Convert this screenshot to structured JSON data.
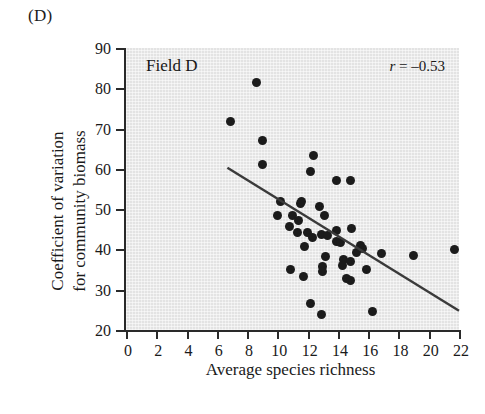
{
  "panel": {
    "letter": "(D)"
  },
  "annotations": {
    "field_label": "Field D",
    "correlation_symbol": "r",
    "correlation_text": " = –0.53",
    "correlation_full": "r = –0.53"
  },
  "axes": {
    "x_title": "Average species richness",
    "y_title_line1": "Coefficient of variation",
    "y_title_line2": "for community biomass",
    "x_ticks": [
      "0",
      "2",
      "4",
      "6",
      "8",
      "10",
      "12",
      "14",
      "16",
      "18",
      "20",
      "22"
    ],
    "y_ticks": [
      "90",
      "80",
      "70",
      "60",
      "50",
      "40",
      "30",
      "20"
    ]
  },
  "colors": {
    "panel_background": "#e3e3e3",
    "axis": "#2a2a2a",
    "point": "#1b1b1b",
    "trend_line": "#3a3a3a",
    "text": "#1a1a1a",
    "page_background": "#ffffff"
  },
  "chart_data": {
    "type": "scatter",
    "title": "Field D",
    "xlabel": "Average species richness",
    "ylabel": "Coefficient of variation for community biomass",
    "xlim": [
      0,
      22
    ],
    "ylim": [
      20,
      90
    ],
    "xticks": [
      0,
      2,
      4,
      6,
      8,
      10,
      12,
      14,
      16,
      18,
      20,
      22
    ],
    "yticks": [
      20,
      30,
      40,
      50,
      60,
      70,
      80,
      90
    ],
    "grid": false,
    "legend": "none",
    "correlation_r": -0.53,
    "annotation": "r = –0.53",
    "points": [
      [
        8.6,
        81.5
      ],
      [
        6.9,
        71.7
      ],
      [
        9.0,
        67.0
      ],
      [
        9.0,
        61.2
      ],
      [
        12.4,
        63.2
      ],
      [
        12.2,
        59.4
      ],
      [
        13.9,
        57.2
      ],
      [
        14.8,
        57.0
      ],
      [
        10.2,
        51.8
      ],
      [
        11.5,
        51.4
      ],
      [
        11.6,
        51.9
      ],
      [
        12.8,
        50.6
      ],
      [
        10.0,
        48.5
      ],
      [
        11.0,
        48.3
      ],
      [
        11.4,
        47.2
      ],
      [
        13.1,
        48.5
      ],
      [
        10.8,
        45.8
      ],
      [
        11.3,
        44.3
      ],
      [
        12.0,
        44.1
      ],
      [
        12.3,
        43.0
      ],
      [
        12.9,
        43.6
      ],
      [
        13.3,
        43.5
      ],
      [
        13.9,
        44.8
      ],
      [
        14.9,
        45.2
      ],
      [
        11.8,
        40.7
      ],
      [
        13.9,
        42.0
      ],
      [
        14.2,
        41.7
      ],
      [
        15.5,
        41.1
      ],
      [
        15.6,
        40.2
      ],
      [
        21.7,
        40.1
      ],
      [
        15.2,
        39.3
      ],
      [
        16.9,
        39.1
      ],
      [
        19.0,
        38.5
      ],
      [
        13.2,
        38.2
      ],
      [
        14.4,
        37.5
      ],
      [
        14.8,
        37.0
      ],
      [
        14.3,
        35.9
      ],
      [
        13.0,
        35.8
      ],
      [
        13.0,
        34.6
      ],
      [
        10.9,
        35.0
      ],
      [
        11.7,
        33.3
      ],
      [
        14.6,
        32.8
      ],
      [
        14.8,
        32.2
      ],
      [
        15.9,
        35.0
      ],
      [
        12.2,
        26.6
      ],
      [
        12.9,
        23.9
      ],
      [
        16.3,
        24.6
      ]
    ],
    "trend_line": {
      "x_start": 6.7,
      "y_start": 60.3,
      "x_end": 22.0,
      "y_end": 24.8
    }
  }
}
